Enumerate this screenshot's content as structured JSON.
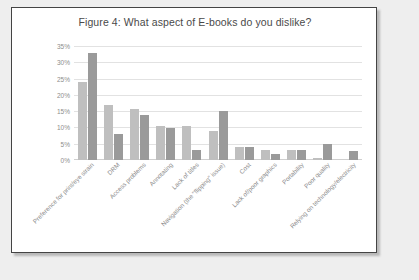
{
  "chart_data": {
    "type": "bar",
    "title": "Figure 4: What aspect of E-books do you dislike?",
    "xlabel": "",
    "ylabel": "",
    "ylim": [
      0,
      35
    ],
    "ytick_labels": [
      "35%",
      "30%",
      "25%",
      "20%",
      "15%",
      "10%",
      "5%",
      "0%"
    ],
    "ytick_values": [
      35,
      30,
      25,
      20,
      15,
      10,
      5,
      0
    ],
    "grid": true,
    "legend_position": "bottom",
    "categories": [
      "Preference for print/eye strain",
      "DRM",
      "Access problems",
      "Annotating",
      "Lack of titles",
      "Navigation (the \"flipping\" issue)",
      "Cost",
      "Lack of/poor graphics",
      "Portability",
      "Poor quality",
      "Relying on technology/electricity"
    ],
    "series": [
      {
        "name": "2009",
        "color": "#bfbfbf",
        "values": [
          24,
          16.8,
          15.8,
          10.5,
          10.5,
          9,
          4,
          3,
          3,
          0.5,
          0
        ]
      },
      {
        "name": "2014",
        "color": "#9a9a9a",
        "values": [
          33,
          8,
          13.9,
          9.8,
          3.2,
          14.9,
          4,
          2,
          3,
          4.8,
          2.8
        ]
      }
    ]
  },
  "legend": {
    "items": [
      {
        "label": "2009"
      },
      {
        "label": "2014"
      }
    ]
  }
}
